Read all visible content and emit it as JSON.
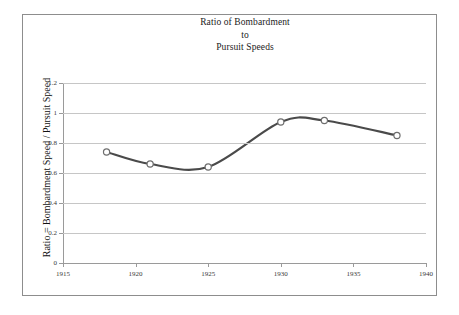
{
  "chart_data": {
    "type": "line",
    "title": "Ratio of Bombardment to Pursuit Speeds",
    "title_lines": [
      "Ratio of Bombardment",
      "to",
      "Pursuit Speeds"
    ],
    "xlabel": "",
    "ylabel": "Ratio = Bombardment Speed / Pursuit Speed",
    "xlim": [
      1915,
      1940
    ],
    "ylim": [
      0,
      1.2
    ],
    "xticks": [
      1915,
      1920,
      1925,
      1930,
      1935,
      1940
    ],
    "xtick_labels": [
      "1915",
      "1920",
      "1925",
      "1930",
      "1935",
      "1940"
    ],
    "yticks": [
      0,
      0.2,
      0.4,
      0.6,
      0.8,
      1,
      1.2
    ],
    "ytick_labels": [
      "0",
      "0.2",
      "0.4",
      "0.6",
      "0.8",
      "1",
      "1.2"
    ],
    "grid": "horizontal",
    "legend": "none",
    "x": [
      1918,
      1921,
      1925,
      1930,
      1933,
      1938
    ],
    "values": [
      0.74,
      0.66,
      0.64,
      0.94,
      0.95,
      0.85
    ],
    "series": [
      {
        "name": "Ratio of Bombardment to Pursuit Speeds",
        "x": [
          1918,
          1921,
          1925,
          1930,
          1933,
          1938
        ],
        "values": [
          0.74,
          0.66,
          0.64,
          0.94,
          0.95,
          0.85
        ]
      }
    ],
    "line_color": "#4a4a4a",
    "marker_face_color": "#ffffff",
    "marker_edge_color": "#6e6e6e",
    "gridline_color": "#c6c6c6",
    "axis_color": "#9a9a9a",
    "background_color": "#ffffff",
    "smoothing": "spline"
  }
}
